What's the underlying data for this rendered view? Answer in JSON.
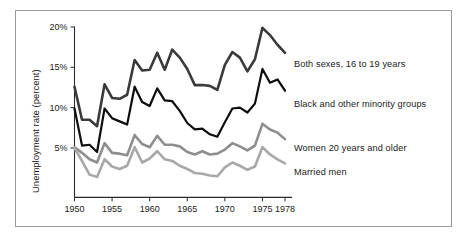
{
  "figure": {
    "border_color": "#9a9a9a",
    "background": "#ffffff"
  },
  "chart_data": {
    "type": "line",
    "title": "",
    "subtitle": "",
    "xlabel": "",
    "ylabel": "Unemployment rate (percent)",
    "xlim": [
      1950,
      1978
    ],
    "ylim": [
      0,
      20
    ],
    "grid": false,
    "legend_position": "right-inline-labels",
    "xticks": [
      1950,
      1955,
      1960,
      1965,
      1970,
      1975,
      1978
    ],
    "xtick_labels": [
      "1950",
      "1955",
      "1960",
      "1965",
      "1970",
      "1975",
      "1978"
    ],
    "yticks": [
      5,
      10,
      15,
      20
    ],
    "ytick_labels": [
      "5%",
      "10%",
      "15%",
      "20%"
    ],
    "x": [
      1950,
      1951,
      1952,
      1953,
      1954,
      1955,
      1956,
      1957,
      1958,
      1959,
      1960,
      1961,
      1962,
      1963,
      1964,
      1965,
      1966,
      1967,
      1968,
      1969,
      1970,
      1971,
      1972,
      1973,
      1974,
      1975,
      1976,
      1977,
      1978
    ],
    "series": [
      {
        "name": "Both sexes, 16 to 19 years",
        "color": "#3a3a3a",
        "width": 2.6,
        "label_x": 1979.4,
        "label_y": 16.8,
        "values": [
          12.6,
          8.5,
          8.5,
          7.7,
          12.9,
          11.2,
          11.1,
          11.6,
          15.9,
          14.6,
          14.7,
          16.8,
          14.7,
          17.2,
          16.2,
          14.8,
          12.8,
          12.8,
          12.7,
          12.2,
          15.3,
          16.9,
          16.2,
          14.5,
          16.0,
          19.9,
          19.0,
          17.8,
          16.8
        ]
      },
      {
        "name": "Black and other minority groups",
        "color": "#0d0d0d",
        "width": 2.2,
        "label_x": 1979.4,
        "label_y": 12.1,
        "values": [
          9.9,
          5.3,
          5.4,
          4.5,
          9.9,
          8.7,
          8.3,
          7.9,
          12.6,
          10.7,
          10.2,
          12.4,
          10.9,
          10.8,
          9.6,
          8.1,
          7.3,
          7.4,
          6.7,
          6.4,
          8.2,
          9.9,
          10.0,
          9.4,
          10.5,
          14.8,
          13.1,
          13.5,
          12.1
        ]
      },
      {
        "name": "Women 20 years and older",
        "color": "#8e8e8e",
        "width": 2.6,
        "label_x": 1979.4,
        "label_y": 6.1,
        "values": [
          5.1,
          4.4,
          3.6,
          3.2,
          5.6,
          4.4,
          4.3,
          4.1,
          6.6,
          5.5,
          5.1,
          6.5,
          5.4,
          5.4,
          5.2,
          4.5,
          4.2,
          4.6,
          4.2,
          4.3,
          4.8,
          5.6,
          5.2,
          4.7,
          5.3,
          8.0,
          7.3,
          6.9,
          6.1
        ]
      },
      {
        "name": "Married men",
        "color": "#a8a8a8",
        "width": 2.6,
        "label_x": 1979.4,
        "label_y": 3.1,
        "values": [
          5.0,
          3.4,
          1.7,
          1.4,
          3.6,
          2.7,
          2.4,
          2.8,
          5.1,
          3.2,
          3.7,
          4.6,
          3.6,
          3.4,
          2.8,
          2.4,
          1.9,
          1.8,
          1.6,
          1.5,
          2.6,
          3.2,
          2.8,
          2.3,
          2.7,
          5.1,
          4.2,
          3.6,
          3.1
        ]
      }
    ]
  },
  "axis": {
    "y_title": "Unemployment rate (percent)"
  }
}
